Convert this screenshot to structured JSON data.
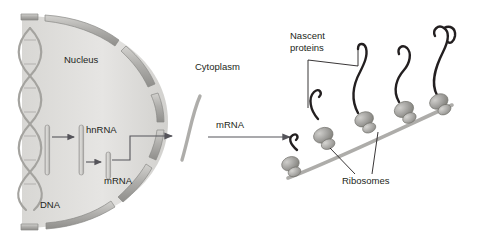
{
  "figure": {
    "name": "transcription-translation-diagram",
    "background_color": "#ffffff"
  },
  "labels": {
    "nucleus": "Nucleus",
    "cytoplasm": "Cytoplasm",
    "dna": "DNA",
    "hnrna": "hnRNA",
    "mrna_nuclear": "mRNA",
    "mrna_cytoplasmic": "mRNA",
    "nascent_proteins_line1": "Nascent",
    "nascent_proteins_line2": "proteins",
    "ribosomes": "Ribosomes"
  },
  "colors": {
    "nucleus_fill": "#e3e2e0",
    "envelope_fill": "#b9b8b5",
    "envelope_stroke": "#8d8c89",
    "rna_bar_fill": "#cfcecb",
    "rna_bar_stroke": "#8d8c89",
    "dna_helix": "#a9a8a5",
    "mrna_strand": "#b5b4b1",
    "ribosome_large": "#9b9a97",
    "ribosome_small": "#aeada9",
    "protein_chain": "#231f20",
    "arrow": "#58575a",
    "leader_line": "#231f20",
    "text": "#231f20"
  },
  "structures": {
    "nucleus": "half-disc nuclear compartment on the left",
    "nuclear_envelope_segments": 8,
    "dna_double_helix": "vertical twisted double strand at left edge of nucleus",
    "transcription_arrows": 2,
    "export_arrow": "arrow from nucleus through envelope into cytoplasm",
    "cytoplasm_arrow": "horizontal arrow from free mRNA to polysome",
    "ribosome_count": 5,
    "nascent_protein_count": 5,
    "polysome_mrna": "gray strand rising to the right bearing ribosomes"
  }
}
